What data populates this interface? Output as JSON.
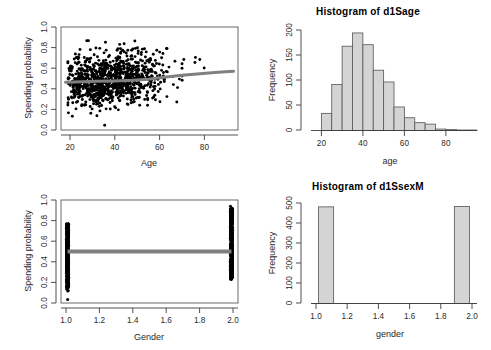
{
  "figure": {
    "background": "#ffffff",
    "point_color": "#000000",
    "line_color": "#808080",
    "bar_fill": "#d4d4d4",
    "bar_stroke": "#555555",
    "axis_color": "#3c3c3c",
    "layout": "2x2 panel"
  },
  "panels": {
    "top_left": {
      "name": "scatter-age-spending",
      "title": "",
      "chart": {
        "type": "scatter",
        "title": "",
        "xlabel": "Age",
        "ylabel": "Spending probability",
        "xlim": [
          16,
          95
        ],
        "ylim": [
          -0.02,
          1.02
        ],
        "xticks": [
          "20",
          "40",
          "60",
          "80"
        ],
        "xtick_values": [
          20,
          40,
          60,
          80
        ],
        "yticks": [
          "0.0",
          "0.2",
          "0.4",
          "0.6",
          "0.8",
          "1.0"
        ],
        "ytick_values": [
          0.0,
          0.2,
          0.4,
          0.6,
          0.8,
          1.0
        ],
        "grid": false,
        "legend": "none",
        "frame": "box",
        "n_points": 1000,
        "point_cloud_note": "dense black cloud, mode age 25-55, probability 0.2-0.8",
        "smoother": {
          "name": "loess-trend-line",
          "color": "#808080",
          "width": 3,
          "x": [
            18,
            25,
            32,
            40,
            48,
            55,
            62,
            70,
            78,
            86,
            93
          ],
          "y": [
            0.462,
            0.468,
            0.472,
            0.476,
            0.482,
            0.492,
            0.512,
            0.532,
            0.549,
            0.562,
            0.572
          ]
        }
      }
    },
    "top_right": {
      "name": "histogram-age",
      "title": "Histogram of d1Sage",
      "chart": {
        "type": "bar",
        "title": "Histogram of d1Sage",
        "xlabel": "age",
        "ylabel": "Frequency",
        "xlim": [
          15,
          95
        ],
        "ylim": [
          0,
          205
        ],
        "xticks": [
          "20",
          "40",
          "60",
          "80"
        ],
        "xtick_values": [
          20,
          40,
          60,
          80
        ],
        "yticks": [
          "0",
          "50",
          "100",
          "150",
          "200"
        ],
        "ytick_values": [
          0,
          50,
          100,
          150,
          200
        ],
        "grid": false,
        "legend": "none",
        "bin_width": 5,
        "bin_edges": [
          20,
          25,
          30,
          35,
          40,
          45,
          50,
          55,
          60,
          65,
          70,
          75,
          80,
          85,
          90,
          95
        ],
        "categories": [
          "20-25",
          "25-30",
          "30-35",
          "35-40",
          "40-45",
          "45-50",
          "50-55",
          "55-60",
          "60-65",
          "65-70",
          "70-75",
          "75-80",
          "80-85",
          "85-90",
          "90-95"
        ],
        "values": [
          35,
          94,
          172,
          199,
          175,
          123,
          99,
          48,
          26,
          16,
          13,
          3,
          2,
          1,
          1
        ]
      }
    },
    "bottom_left": {
      "name": "scatter-gender-spending",
      "title": "",
      "chart": {
        "type": "scatter",
        "title": "",
        "xlabel": "Gender",
        "ylabel": "Spending probability",
        "xlim": [
          0.96,
          2.04
        ],
        "ylim": [
          -0.02,
          1.02
        ],
        "xticks": [
          "1.0",
          "1.2",
          "1.4",
          "1.6",
          "1.8",
          "2.0"
        ],
        "xtick_values": [
          1.0,
          1.2,
          1.4,
          1.6,
          1.8,
          2.0
        ],
        "yticks": [
          "0.0",
          "0.2",
          "0.4",
          "0.6",
          "0.8",
          "1.0"
        ],
        "ytick_values": [
          0.0,
          0.2,
          0.4,
          0.6,
          0.8,
          1.0
        ],
        "grid": false,
        "legend": "none",
        "frame": "box",
        "strips": [
          {
            "x": 1.0,
            "y_min": 0.0,
            "y_max": 0.78,
            "dense_from": 0.14,
            "dense_to": 0.78
          },
          {
            "x": 2.0,
            "y_min": 0.22,
            "y_max": 1.0,
            "dense_from": 0.22,
            "dense_to": 0.93
          }
        ],
        "smoother": {
          "name": "flat-trend-line",
          "color": "#808080",
          "width": 4,
          "x": [
            1.0,
            2.0
          ],
          "y": [
            0.5,
            0.5
          ]
        }
      }
    },
    "bottom_right": {
      "name": "histogram-gender",
      "title": "Histogram of d1SsexM",
      "chart": {
        "type": "bar",
        "title": "Histogram of d1SsexM",
        "xlabel": "gender",
        "ylabel": "Frequency",
        "xlim": [
          0.95,
          2.05
        ],
        "ylim": [
          0,
          520
        ],
        "xticks": [
          "1.0",
          "1.2",
          "1.4",
          "1.6",
          "1.8",
          "2.0"
        ],
        "xtick_values": [
          1.0,
          1.2,
          1.4,
          1.6,
          1.8,
          2.0
        ],
        "yticks": [
          "0",
          "100",
          "200",
          "300",
          "400",
          "500"
        ],
        "ytick_values": [
          0,
          100,
          200,
          300,
          400,
          500
        ],
        "grid": false,
        "legend": "none",
        "bin_width": 0.1,
        "categories": [
          "1.0-1.1",
          "1.9-2.0"
        ],
        "bar_left_edges": [
          1.0,
          1.9
        ],
        "values": [
          500,
          502
        ]
      }
    }
  }
}
